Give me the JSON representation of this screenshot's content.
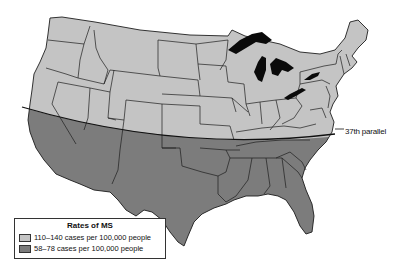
{
  "map": {
    "title": "Rates of MS in the United States",
    "annotation": "37th parallel",
    "colors": {
      "north_region": "#c4c4c4",
      "south_region": "#7c7c7c",
      "lakes": "#0a0a0a",
      "borders": "#1e1e1e",
      "background": "#ffffff"
    }
  },
  "legend": {
    "title": "Rates of MS",
    "items": [
      {
        "label": "110–140 cases per 100,000 people",
        "color": "#c4c4c4"
      },
      {
        "label": "58–78 cases per 100,000 people",
        "color": "#7c7c7c"
      }
    ]
  }
}
